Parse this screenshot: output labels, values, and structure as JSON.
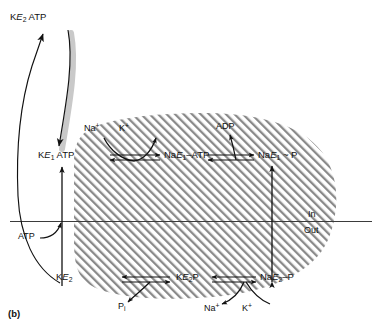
{
  "figure": {
    "label": "(b)",
    "type": "Na+/K+-ATPase reaction cycle (Post-Albers scheme)"
  },
  "membrane": {
    "inside_label": "In",
    "outside_label": "Out",
    "fill_pattern": "diagonal-hatch",
    "hatch_color": "#8a8a8a",
    "line_color": "#3b3b3b"
  },
  "states": {
    "ke2_atp_top": {
      "prefix": "K",
      "enzyme": "E",
      "sub": "2",
      "suffix": " ATP"
    },
    "ke1_atp": {
      "prefix": "K",
      "enzyme": "E",
      "sub": "1",
      "suffix": " ATP"
    },
    "nae1_atp": {
      "prefix": "Na",
      "enzyme": "E",
      "sub": "1",
      "suffix": "–ATP"
    },
    "nae1_p": {
      "prefix": "Na",
      "enzyme": "E",
      "sub": "1",
      "suffix": " ~ P"
    },
    "nae2_p": {
      "prefix": "Na",
      "enzyme": "E",
      "sub": "2",
      "suffix": "–P"
    },
    "ke2_p": {
      "prefix": "K",
      "enzyme": "E",
      "sub": "2",
      "suffix": "P"
    },
    "ke2": {
      "prefix": "K",
      "enzyme": "E",
      "sub": "2",
      "suffix": ""
    }
  },
  "ligands": {
    "na_in": {
      "text": "Na",
      "charge": "+"
    },
    "k_out_top": {
      "text": "K",
      "charge": "+"
    },
    "adp": "ADP",
    "atp": "ATP",
    "na_out_bottom": {
      "text": "Na",
      "charge": "+"
    },
    "k_in_bottom": {
      "text": "K",
      "charge": "+"
    },
    "pi": {
      "text": "P",
      "sub": "i"
    }
  },
  "colors": {
    "ink": "#111111",
    "hatch": "#8a8a8a",
    "shadow": "#bdbdbd",
    "background": "#ffffff"
  }
}
